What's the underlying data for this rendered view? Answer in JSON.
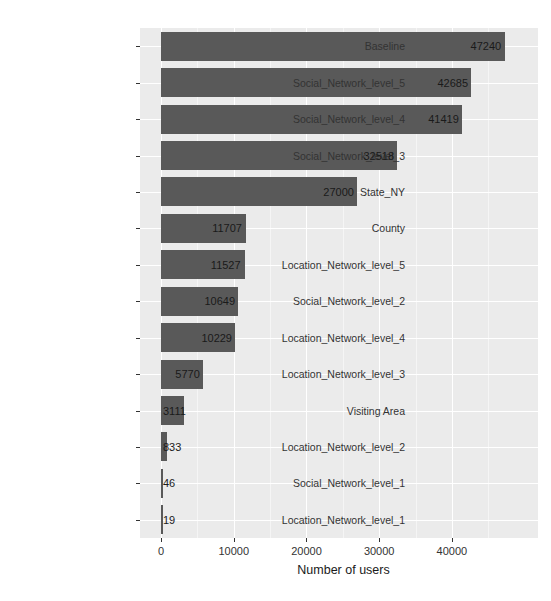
{
  "chart_data": {
    "type": "bar",
    "orientation": "horizontal",
    "title": "",
    "subtitle": "",
    "xlabel": "Number of users",
    "ylabel": "",
    "xlim": [
      0,
      49500
    ],
    "grid": true,
    "legend": null,
    "bar_color": "#595959",
    "panel_color": "#ebebeb",
    "gridline_color": "#ffffff",
    "xticks": [
      0,
      10000,
      20000,
      30000,
      40000
    ],
    "xticklabels": [
      "0",
      "10000",
      "20000",
      "30000",
      "40000"
    ],
    "categories": [
      "Baseline",
      "Social_Network_level_5",
      "Social_Network_level_4",
      "Social_Network_level_3",
      "State_NY",
      "County",
      "Location_Network_level_5",
      "Social_Network_level_2",
      "Location_Network_level_4",
      "Location_Network_level_3",
      "Visiting Area",
      "Location_Network_level_2",
      "Social_Network_level_1",
      "Location_Network_level_1"
    ],
    "values": [
      47240,
      42685,
      41419,
      32518,
      27000,
      11707,
      11527,
      10649,
      10229,
      5770,
      3111,
      833,
      46,
      19
    ],
    "value_labels": [
      "47240",
      "42685",
      "41419",
      "32518",
      "27000",
      "11707",
      "11527",
      "10649",
      "10229",
      "5770",
      "3111",
      "833",
      "46",
      "19"
    ]
  }
}
